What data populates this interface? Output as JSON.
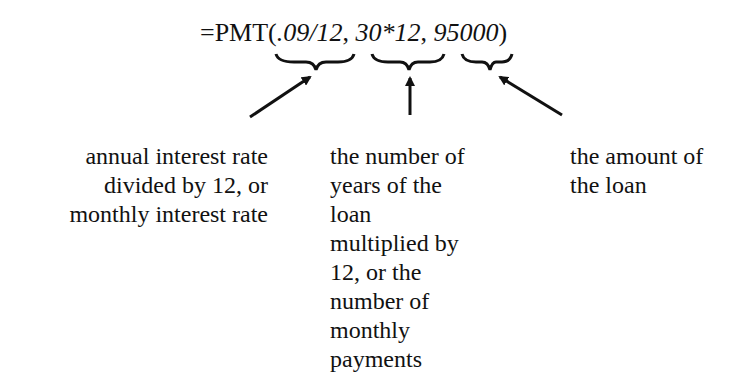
{
  "formula": {
    "prefix": "=PMT(",
    "arg1": ".09/12",
    "sep1": ", ",
    "arg2": "30*12",
    "sep2": ", ",
    "arg3": "95000",
    "suffix": ")"
  },
  "annotations": [
    {
      "target": "arg1",
      "lines": [
        "annual interest rate",
        "divided by 12, or",
        "monthly interest rate"
      ]
    },
    {
      "target": "arg2",
      "lines": [
        "the number of",
        "years of the loan",
        "multiplied by",
        "12, or the",
        "number of",
        "monthly",
        "payments"
      ]
    },
    {
      "target": "arg3",
      "lines": [
        "the amount of",
        "the loan"
      ]
    }
  ]
}
